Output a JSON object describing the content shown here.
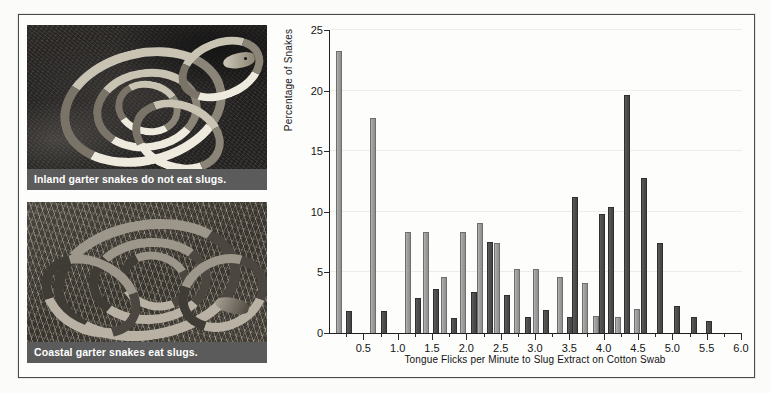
{
  "figure": {
    "background_color": "#fdfdfc",
    "frame_color": "#4a4a4a"
  },
  "photos": [
    {
      "name": "inland-garter-snake-photo",
      "caption": "Inland garter snakes do not eat slugs.",
      "subject": "inland garter snake coiled on dark soil",
      "caption_bar_color": "#5b5b5b",
      "caption_text_color": "#ffffff"
    },
    {
      "name": "coastal-garter-snake-photo",
      "caption": "Coastal garter snakes eat slugs.",
      "subject": "coastal garter snake coiled on dry grass and straw",
      "caption_bar_color": "#5b5b5b",
      "caption_text_color": "#ffffff"
    }
  ],
  "chart_data": {
    "type": "bar",
    "title": "",
    "subtitle": "",
    "xlabel": "Tongue Flicks per Minute to Slug Extract on Cotton Swab",
    "ylabel": "Percentage of Snakes",
    "xlim": [
      0,
      6.0
    ],
    "ylim": [
      0,
      25
    ],
    "ytick_labels": [
      "0",
      "5",
      "10",
      "15",
      "20",
      "25"
    ],
    "yticks": [
      0,
      5,
      10,
      15,
      20,
      25
    ],
    "xtick_labels": [
      "0.5",
      "1.0",
      "1.5",
      "2.0",
      "2.5",
      "3.0",
      "3.5",
      "4.0",
      "4.5",
      "5.0",
      "5.5",
      "6.0"
    ],
    "xticks_major": [
      0.5,
      1.0,
      1.5,
      2.0,
      2.5,
      3.0,
      3.5,
      4.0,
      4.5,
      5.0,
      5.5,
      6.0
    ],
    "xticks_minor": [
      0.25,
      0.75,
      1.25,
      1.75,
      2.25,
      2.75,
      3.25,
      3.75,
      4.25,
      4.75,
      5.25,
      5.75
    ],
    "grid": "horizontal",
    "grid_color": "#ececeb",
    "legend_position": "none",
    "bin_width": 0.25,
    "bar_colors": {
      "light": "#9e9e9e",
      "dark": "#4d4d4d"
    },
    "series": [
      {
        "name": "Coastal garter snakes",
        "color": "#9e9e9e",
        "values": [
          23.3,
          17.7,
          0,
          8.3,
          8.3,
          4.6,
          8.3,
          9.1,
          5.3,
          5.3,
          0,
          4.6,
          11.2,
          10.4,
          1.4,
          0,
          0,
          0,
          0,
          0,
          0,
          0,
          0,
          0
        ],
        "x": [
          0.125,
          0.625,
          0.875,
          1.125,
          1.375,
          1.625,
          1.875,
          2.125,
          2.375,
          2.625,
          2.875,
          3.125,
          3.375,
          3.625,
          3.875,
          4.125,
          4.375,
          4.625,
          4.875,
          5.125,
          5.375,
          5.625,
          5.875,
          6.0
        ]
      },
      {
        "name": "Inland garter snakes",
        "color": "#4d4d4d",
        "values": [
          1.8,
          1.8,
          2.9,
          3.6,
          1.2,
          1.0,
          3.4,
          9.6,
          3.1,
          1.3,
          1.1,
          1.3,
          4.1,
          1.3,
          10.4,
          19.6,
          2.0,
          12.8,
          7.4,
          2.2,
          1.3,
          1.0,
          0,
          0
        ],
        "x": [
          0.25,
          0.75,
          1.25,
          1.5,
          1.75,
          2.0,
          2.25,
          2.5,
          2.75,
          3.0,
          3.25,
          3.5,
          3.625,
          3.75,
          3.875,
          4.125,
          4.25,
          4.375,
          4.625,
          5.0,
          5.25,
          5.5,
          5.75,
          6.0
        ]
      }
    ],
    "bars": [
      {
        "x": 0.125,
        "value": 23.3,
        "series": "light"
      },
      {
        "x": 0.27,
        "value": 1.8,
        "series": "dark"
      },
      {
        "x": 0.63,
        "value": 17.7,
        "series": "light"
      },
      {
        "x": 0.78,
        "value": 1.8,
        "series": "dark"
      },
      {
        "x": 1.13,
        "value": 8.3,
        "series": "light"
      },
      {
        "x": 1.28,
        "value": 2.9,
        "series": "dark"
      },
      {
        "x": 1.4,
        "value": 8.3,
        "series": "light"
      },
      {
        "x": 1.55,
        "value": 3.6,
        "series": "dark"
      },
      {
        "x": 1.66,
        "value": 4.6,
        "series": "light"
      },
      {
        "x": 1.81,
        "value": 1.2,
        "series": "dark"
      },
      {
        "x": 1.94,
        "value": 8.3,
        "series": "light"
      },
      {
        "x": 2.09,
        "value": 3.4,
        "series": "dark"
      },
      {
        "x": 2.18,
        "value": 9.1,
        "series": "light"
      },
      {
        "x": 2.33,
        "value": 7.5,
        "series": "dark"
      },
      {
        "x": 2.43,
        "value": 7.4,
        "series": "light"
      },
      {
        "x": 2.58,
        "value": 3.1,
        "series": "dark"
      },
      {
        "x": 2.73,
        "value": 5.3,
        "series": "light"
      },
      {
        "x": 2.88,
        "value": 1.3,
        "series": "dark"
      },
      {
        "x": 3.0,
        "value": 5.3,
        "series": "light"
      },
      {
        "x": 3.15,
        "value": 1.9,
        "series": "dark"
      },
      {
        "x": 3.35,
        "value": 4.6,
        "series": "light"
      },
      {
        "x": 3.5,
        "value": 1.3,
        "series": "dark"
      },
      {
        "x": 3.57,
        "value": 11.2,
        "series": "dark"
      },
      {
        "x": 3.72,
        "value": 4.1,
        "series": "light"
      },
      {
        "x": 3.87,
        "value": 1.4,
        "series": "light"
      },
      {
        "x": 3.96,
        "value": 9.8,
        "series": "dark"
      },
      {
        "x": 4.09,
        "value": 10.4,
        "series": "dark"
      },
      {
        "x": 4.19,
        "value": 1.3,
        "series": "light"
      },
      {
        "x": 4.33,
        "value": 19.6,
        "series": "dark"
      },
      {
        "x": 4.47,
        "value": 2.0,
        "series": "light"
      },
      {
        "x": 4.58,
        "value": 12.8,
        "series": "dark"
      },
      {
        "x": 4.81,
        "value": 7.4,
        "series": "dark"
      },
      {
        "x": 5.05,
        "value": 2.2,
        "series": "dark"
      },
      {
        "x": 5.3,
        "value": 1.3,
        "series": "dark"
      },
      {
        "x": 5.52,
        "value": 1.0,
        "series": "dark"
      }
    ]
  }
}
